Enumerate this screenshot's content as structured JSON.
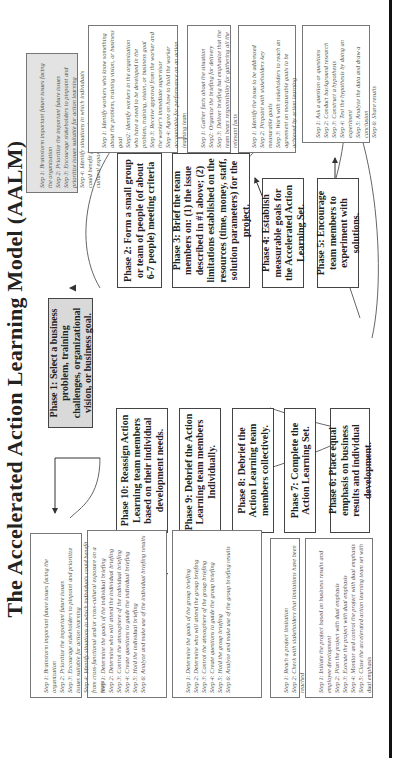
{
  "title": "The Accelerated Action Learning Model (AALM)",
  "phases": [
    {
      "id": 1,
      "label": "Phase 1: Select a business problem, training challenges, organizational vision, or business goal."
    },
    {
      "id": 2,
      "label": "Phase 2: Form a small group or team of people (of about 6-7 people) meeting criteria"
    },
    {
      "id": 3,
      "label": "Phase 3: Brief the team members on: (1) the issue described in #1 above; (2) limitations established on the resources (time, money, staff, solution parameters) for the project."
    },
    {
      "id": 4,
      "label": "Phase 4: Establish measurable goals for the Accelerated Action Learning Set."
    },
    {
      "id": 5,
      "label": "Phase 5: Encourage team members to experiment with solutions."
    },
    {
      "id": 6,
      "label": "Phase 6: Place equal emphasis on business results and individual development."
    },
    {
      "id": 7,
      "label": "Phase 7: Complete the Action Learning Set."
    },
    {
      "id": 8,
      "label": "Phase 8: Debrief the Action Learning team members collectively."
    },
    {
      "id": 9,
      "label": "Phase 9: Debrief the Action Learning team members Individually."
    },
    {
      "id": 10,
      "label": "Phase 10: Reassign Action Learning team members based on their individual development needs."
    }
  ],
  "steps": {
    "phase1": "Step 1: Brainstorm important future issues facing the organization\nStep 2: Prioritize the important future issues\nStep 3: Encourage stakeholders to pinpoint and prioritize issues suitable for action learning\nStep 4: Identify situations in which individuals could benefit from cross-functional and/or cross-cultural exposure on a team",
    "phase2": "Step 1: Identify workers who know something about the problem, training vision, or business goal\nStep2: Identify workers in the organization who have a need to be developed in the problem, training, vision, or business goal\nStep 3: Receive approval from the worker and the worker's immediate supervisor\nStep 4: Agree on how to hold the worker accountable for performance on an action learning team",
    "phase3": "Step 1: Gather facts about the situation\nStep2: Organize the briefing for delivery\nStep 3: Deliver briefing but emphasize that the team bears responsibility for gathering all the relevant facts",
    "phase4": "Step 1: Identify the issue to be addressed\nStep 2: Pinpoint with stakeholders key measurable goals\nStep 3: Work with stakeholders to reach an agreement on measurable goals to be achieved by action learning",
    "phase5": "Step 1: Ask a question or questions\nStep 2: Conduct background research\nStep 3: Construct a hypothesis\nStep 4: Test the hypothesis by doing an experiment\nStep 5: Analyze the data and draw a conclusion\nStep 6: Share results",
    "phase6": "Step 1: Initiate the project based on business results and employee development\nStep 2: Plan the project with dual emphasis\nStep 3: Execute the project with dual emphasis\nStep 4: Monitor and control the project with dual emphasis\nStep 5: Close the accelerated action learning team set with dual emphasis",
    "phase7": "Step 1: Reach a project limitation\nStep 2: Check with stakeholders that limitations have been reached",
    "phase8": "Step 1: Determine the goals of the group briefing\nStep 2: Determine who will attend the group briefing\nStep 3: Control the atmosphere of the group briefing\nStep 4: Create questions to guide the group briefing\nStep 5: Hold the group briefing\nStep 6: Analyze and make use of the group briefing results",
    "phase9": "Step 1: Determine the goals of the individual briefing\nStep 2: Determine who will attend the individual briefing\nStep 3: Control the atmosphere of the individual briefing\nStep 4: Create questions to guide the individual briefing\nStep 5: Hold the individual briefing\nStep 6: Analyze and make use of the individual briefing results",
    "phase10": "Step 1: Brainstorm important future issues facing the organization\nStep 2: Prioritize the important future issues\nStep 3: Encourage stakeholders to pinpoint and prioritize issues suitable for action learning\nStep 4: Identify situations in which individuals could benefit from cross-functional and/or cross-cultural exposure on a team"
  },
  "colors": {
    "highlight_fill": "#d9d9d9",
    "border": "#444444"
  }
}
